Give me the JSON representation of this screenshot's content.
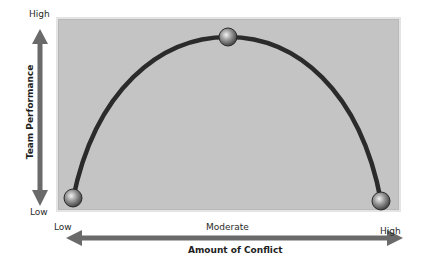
{
  "diagram": {
    "type": "inverted-u-curve",
    "y_axis": {
      "title": "Team Performance",
      "high_label": "High",
      "low_label": "Low"
    },
    "x_axis": {
      "title": "Amount of Conflict",
      "low_label": "Low",
      "mid_label": "Moderate",
      "high_label": "High"
    },
    "points": [
      {
        "name": "low-conflict-point",
        "conflict": "Low",
        "performance": "Low"
      },
      {
        "name": "moderate-conflict-point",
        "conflict": "Moderate",
        "performance": "High"
      },
      {
        "name": "high-conflict-point",
        "conflict": "High",
        "performance": "Low"
      }
    ],
    "colors": {
      "plot_background": "#c4c4c4",
      "curve": "#2b2b2b",
      "arrows": "#6a6a6a",
      "point": "#8a8a8a"
    }
  }
}
